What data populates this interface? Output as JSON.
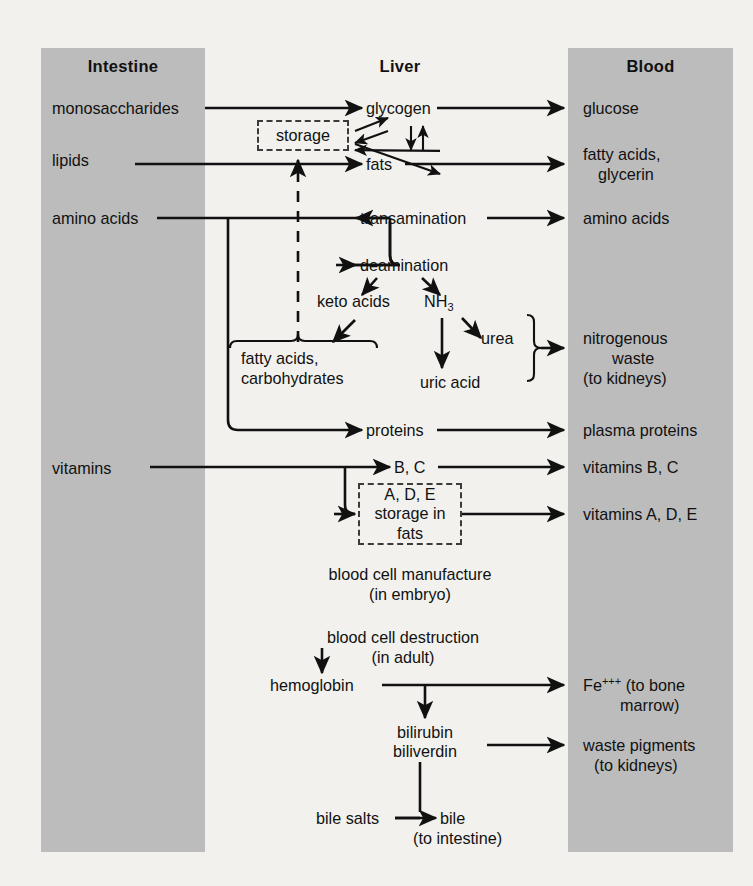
{
  "diagram": {
    "colors": {
      "band_gray": "#bcbcbc",
      "background": "#f2f1ee",
      "ink": "#111111"
    },
    "columns": [
      {
        "key": "intestine",
        "label": "Intestine"
      },
      {
        "key": "liver",
        "label": "Liver"
      },
      {
        "key": "blood",
        "label": "Blood"
      }
    ],
    "intestine_items": [
      {
        "key": "monosaccharides",
        "label": "monosaccharides"
      },
      {
        "key": "lipids",
        "label": "lipids"
      },
      {
        "key": "amino_acids",
        "label": "amino acids"
      },
      {
        "key": "vitamins",
        "label": "vitamins"
      }
    ],
    "liver_items": [
      {
        "key": "glycogen",
        "label": "glycogen"
      },
      {
        "key": "storage",
        "label": "storage"
      },
      {
        "key": "fats",
        "label": "fats"
      },
      {
        "key": "transamination",
        "label": "transamination"
      },
      {
        "key": "deamination",
        "label": "deamination"
      },
      {
        "key": "keto_acids",
        "label": "keto acids"
      },
      {
        "key": "ammonia",
        "label": "NH",
        "sub": "3"
      },
      {
        "key": "urea",
        "label": "urea"
      },
      {
        "key": "uric_acid",
        "label": "uric acid"
      },
      {
        "key": "fatty_carbs_line1",
        "label": "fatty acids,"
      },
      {
        "key": "fatty_carbs_line2",
        "label": "carbohydrates"
      },
      {
        "key": "proteins",
        "label": "proteins"
      },
      {
        "key": "vitamins_bc",
        "label": "B, C"
      },
      {
        "key": "vitamin_store_line1",
        "label": "A, D, E"
      },
      {
        "key": "vitamin_store_line2",
        "label": "storage in"
      },
      {
        "key": "vitamin_store_line3",
        "label": "fats"
      },
      {
        "key": "blood_manufacture_line1",
        "label": "blood cell manufacture"
      },
      {
        "key": "blood_manufacture_line2",
        "label": "(in embryo)"
      },
      {
        "key": "blood_destruction_line1",
        "label": "blood cell destruction"
      },
      {
        "key": "blood_destruction_line2",
        "label": "(in adult)"
      },
      {
        "key": "hemoglobin",
        "label": "hemoglobin"
      },
      {
        "key": "bilirubin",
        "label": "bilirubin"
      },
      {
        "key": "biliverdin",
        "label": "biliverdin"
      },
      {
        "key": "bile_salts",
        "label": "bile salts"
      },
      {
        "key": "bile",
        "label": "bile"
      },
      {
        "key": "bile_note",
        "label": "(to intestine)"
      }
    ],
    "blood_items": [
      {
        "key": "glucose",
        "label": "glucose"
      },
      {
        "key": "fatty_acids",
        "label": "fatty acids,"
      },
      {
        "key": "glycerin",
        "label": "glycerin"
      },
      {
        "key": "amino_acids_blood",
        "label": "amino acids"
      },
      {
        "key": "nitrogenous",
        "label": "nitrogenous"
      },
      {
        "key": "waste",
        "label": "waste"
      },
      {
        "key": "to_kidneys",
        "label": "(to kidneys)"
      },
      {
        "key": "plasma_proteins",
        "label": "plasma proteins"
      },
      {
        "key": "vitamins_bc_blood",
        "label": "vitamins B, C"
      },
      {
        "key": "vitamins_ade_blood",
        "label": "vitamins A, D, E"
      },
      {
        "key": "iron",
        "label": "Fe",
        "sup": "+++",
        "tail": " (to bone"
      },
      {
        "key": "marrow",
        "label": "marrow)"
      },
      {
        "key": "waste_pigments",
        "label": "waste pigments"
      },
      {
        "key": "waste_pigments_note",
        "label": "(to kidneys)"
      }
    ]
  }
}
